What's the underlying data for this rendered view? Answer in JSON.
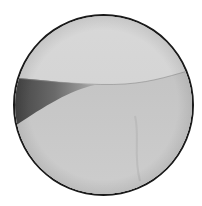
{
  "image": {
    "description": "Circular grayscale endoscopic/arthroscopic view showing a curved tissue edge with a dark shadowed wedge on the left",
    "colors": {
      "border": "#1a1a1a",
      "upper_region": "#d4d4d4",
      "lower_region": "#c6c6c6",
      "shadow": "#3a3a3a",
      "background": "#ffffff"
    }
  }
}
